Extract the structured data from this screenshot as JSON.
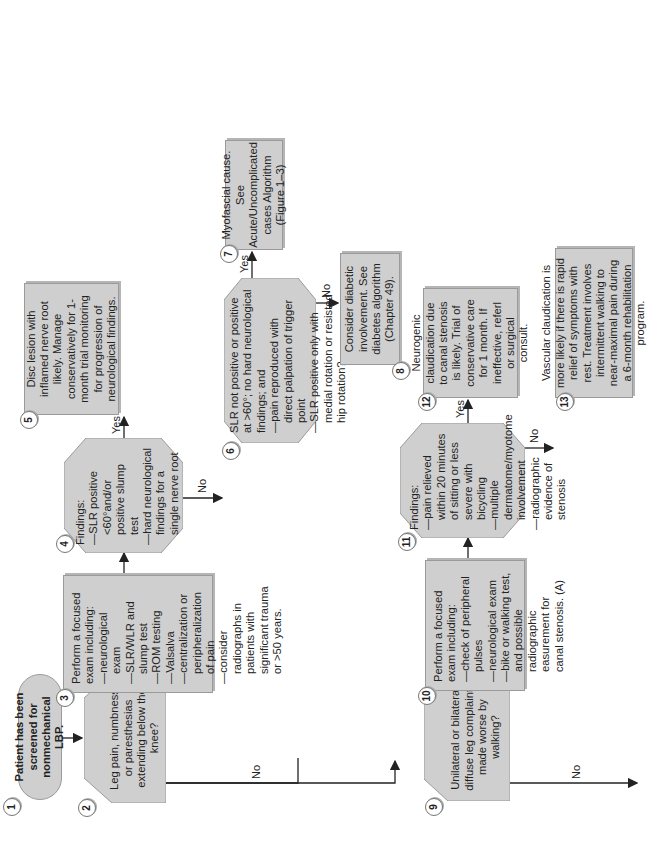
{
  "diagram": {
    "orientation": "rotated 90 degrees counter-clockwise",
    "colors": {
      "box_fill": "#cfcfcf",
      "box_border": "#9a9a9a",
      "line": "#222222",
      "background": "#ffffff"
    },
    "edge_labels": {
      "yes": "Yes",
      "no": "No"
    },
    "nodes": {
      "n1": {
        "number": "1",
        "type": "terminal",
        "text": "Patient has been screened for nonmechanical LBP."
      },
      "n2": {
        "number": "2",
        "type": "decision",
        "text": "Leg pain, numbness, or paresthesias extending below the knee?"
      },
      "n3": {
        "number": "3",
        "type": "process",
        "heading": "Perform a focused exam including:",
        "items": [
          "—neurological exam",
          "—SLR/WLR and slump test",
          "—ROM testing",
          "—Valsalva",
          "—centralization or peripheralization of pain",
          "—consider radiographs in patients with significant trauma or >50 years."
        ]
      },
      "n4": {
        "number": "4",
        "type": "decision",
        "heading": "Findings:",
        "items": [
          "—SLR positive <60°and/or positive slump test",
          "—hard neurological findings for a single nerve root"
        ]
      },
      "n5": {
        "number": "5",
        "type": "process",
        "text": "Disc lesion with inflamed nerve root likely. Manage conservatively for 1-month trial monitoring for progression of neurological findings."
      },
      "n6": {
        "number": "6",
        "type": "decision",
        "items": [
          "SLR not positive or positive at >60°; no hard neurological findings; and",
          "—pain reproduced with direct palpation of trigger point",
          "—SLR positive only with medial rotation or resisted hip rotation?"
        ]
      },
      "n7": {
        "number": "7",
        "type": "process",
        "text": "Myofascial cause. See Acute/Uncomplicated cases Algorithm (Figure 1–3)"
      },
      "n8": {
        "number": "8",
        "type": "process",
        "text": "Consider diabetic involvement. See diabetes algorithm (Chapter 49)."
      },
      "n9": {
        "number": "9",
        "type": "decision",
        "text": "Unilateral or bilateral, diffuse leg complaints made worse by walking?"
      },
      "n10": {
        "number": "10",
        "type": "process",
        "heading": "Perform a focused exam including:",
        "items": [
          "—check of peripheral pulses",
          "—neurological exam",
          "—bike or walking test, and possible radiographic easurement for canal stenosis. (A)"
        ]
      },
      "n11": {
        "number": "11",
        "type": "decision",
        "heading": "Findings:",
        "items": [
          "—pain relieved within 20 minutes of sitting or less severe with bicycling",
          "—multiple dermatome/myotome involvement",
          "—radiographic evidence of stenosis"
        ]
      },
      "n12": {
        "number": "12",
        "type": "process",
        "text": "Neurogenic claudication due to canal stenosis is likely. Trial of conservative care for 1 month. If ineffective, referl or surgical consult."
      },
      "n13": {
        "number": "13",
        "type": "process",
        "text": "Vascular claudication is more likely if there is rapid relief of symptoms with rest. Treatment involves intermittent walking to near-maximal pain during a 6-month rehabilitation program."
      }
    },
    "edges": [
      {
        "from": "1",
        "to": "2",
        "label": ""
      },
      {
        "from": "2",
        "to": "3",
        "label": "Yes"
      },
      {
        "from": "2",
        "to": "9",
        "label": "No"
      },
      {
        "from": "3",
        "to": "4",
        "label": ""
      },
      {
        "from": "4",
        "to": "5",
        "label": "Yes"
      },
      {
        "from": "4",
        "to": "6",
        "label": "No"
      },
      {
        "from": "6",
        "to": "7",
        "label": "Yes"
      },
      {
        "from": "6",
        "to": "8",
        "label": "No"
      },
      {
        "from": "9",
        "to": "10",
        "label": "Yes"
      },
      {
        "from": "9",
        "to": "off-page",
        "label": "No"
      },
      {
        "from": "10",
        "to": "11",
        "label": ""
      },
      {
        "from": "11",
        "to": "12",
        "label": "Yes"
      },
      {
        "from": "11",
        "to": "13",
        "label": "No"
      }
    ]
  }
}
